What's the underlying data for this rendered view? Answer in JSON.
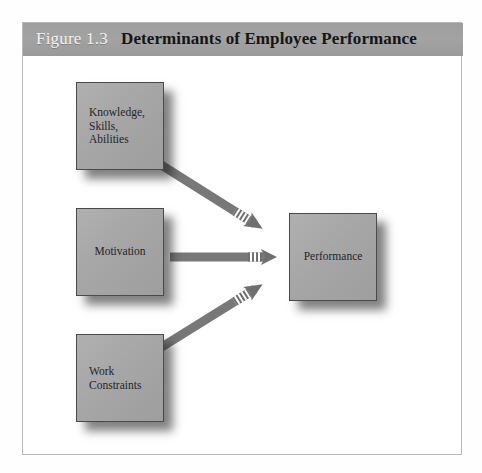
{
  "figure": {
    "number": "Figure 1.3",
    "title": "Determinants of Employee Performance"
  },
  "diagram": {
    "nodes": [
      {
        "id": "ksa",
        "label": "Knowledge,\nSkills,\nAbilities",
        "align": "left"
      },
      {
        "id": "motivation",
        "label": "Motivation",
        "align": "center"
      },
      {
        "id": "constraints",
        "label": "Work\nConstraints",
        "align": "left"
      },
      {
        "id": "performance",
        "label": "Performance",
        "align": "center"
      }
    ],
    "arrows": [
      {
        "id": "ksa-to-performance",
        "from": "ksa",
        "to": "performance",
        "direction": "down-right"
      },
      {
        "id": "motivation-to-performance",
        "from": "motivation",
        "to": "performance",
        "direction": "right"
      },
      {
        "id": "constraints-to-performance",
        "from": "constraints",
        "to": "performance",
        "direction": "up-right"
      }
    ]
  },
  "colors": {
    "header_band": "#9e9e9e",
    "figure_number_text": "#f2f2f2",
    "figure_title_text": "#151515",
    "node_fill": "#a6a6a6",
    "node_border": "#4a4a4a",
    "node_text": "#24242a",
    "arrow": "#787878",
    "frame_border": "#b9b9b9",
    "page_background": "#ffffff"
  }
}
